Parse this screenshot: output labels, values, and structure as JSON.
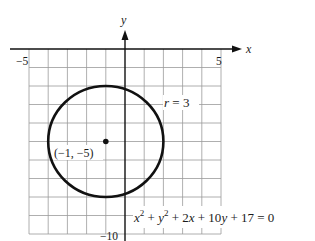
{
  "figure": {
    "type": "circle-graph",
    "axes": {
      "x_label": "x",
      "y_label": "y",
      "x_tick_labels": [
        {
          "value": -5,
          "text": "−5"
        },
        {
          "value": 5,
          "text": "5"
        }
      ],
      "y_tick_labels": [
        {
          "value": -10,
          "text": "−10"
        }
      ],
      "x_range": [
        -5,
        5
      ],
      "y_range": [
        -10,
        0
      ],
      "grid": true,
      "grid_step": 1
    },
    "circle": {
      "center_x": -1,
      "center_y": -5,
      "radius": 3,
      "center_label": "(−1, −5)",
      "radius_label_var": "r",
      "radius_label_eq": " = 3"
    },
    "equation": {
      "t1": "x",
      "sup1": "2",
      "t2": " + ",
      "t3": "y",
      "sup2": "2",
      "t4": " + 2",
      "t5": "x",
      "t6": " + 10",
      "t7": "y",
      "t8": " + 17 = 0"
    },
    "colors": {
      "grid": "#9a9a9a",
      "axis": "#111111",
      "circle": "#111111",
      "background": "#ffffff"
    }
  }
}
